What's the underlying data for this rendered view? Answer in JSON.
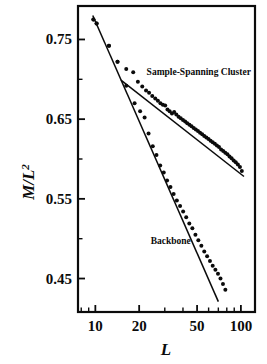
{
  "chart_data": {
    "type": "scatter",
    "title": "",
    "xlabel": "L",
    "ylabel": "M/L",
    "ylabel_exponent": "2",
    "xscale": "log",
    "yscale": "linear",
    "xlim": [
      7.6,
      125
    ],
    "ylim": [
      0.408,
      0.792
    ],
    "grid": false,
    "legend_position": "inline-annotations",
    "x_ticks": [
      10,
      20,
      50,
      100
    ],
    "x_tick_labels": [
      "10",
      "20",
      "50",
      "100"
    ],
    "x_minor_ticks": [
      8,
      9,
      30,
      40,
      60,
      70,
      80,
      90
    ],
    "y_ticks": [
      0.45,
      0.55,
      0.65,
      0.75
    ],
    "y_tick_labels": [
      "0.45",
      "0.55",
      "0.65",
      "0.75"
    ],
    "y_minor_ticks": [
      0.5,
      0.6,
      0.7
    ],
    "series": [
      {
        "name": "Sample-Spanning Cluster",
        "annotation": "Sample-Spanning Cluster",
        "annotation_x": 22.5,
        "annotation_y": 0.709,
        "marker": "filled-circle",
        "color": "#0b0b0b",
        "fit_line": {
          "x": [
            15.0,
            105.0
          ],
          "y": [
            0.699,
            0.578
          ]
        },
        "x": [
          9.7,
          10.2,
          12.4,
          14.2,
          16.3,
          18.2,
          19.6,
          21.0,
          22.3,
          23.4,
          24.6,
          25.8,
          26.9,
          28.0,
          29.1,
          30.2,
          31.3,
          32.4,
          33.6,
          34.8,
          36.0,
          37.3,
          38.6,
          40.0,
          41.4,
          42.8,
          44.3,
          45.8,
          47.4,
          49.0,
          50.7,
          52.4,
          54.2,
          56.0,
          57.9,
          59.9,
          61.9,
          64.0,
          66.2,
          68.4,
          70.7,
          73.1,
          75.6,
          78.1,
          80.8,
          83.5,
          86.3,
          89.2,
          92.2,
          95.3,
          98.5,
          101.5
        ],
        "y": [
          0.775,
          0.77,
          0.742,
          0.722,
          0.713,
          0.709,
          0.697,
          0.691,
          0.686,
          0.683,
          0.679,
          0.676,
          0.673,
          0.67,
          0.668,
          0.667,
          0.662,
          0.66,
          0.657,
          0.659,
          0.656,
          0.653,
          0.651,
          0.649,
          0.647,
          0.645,
          0.643,
          0.641,
          0.639,
          0.637,
          0.635,
          0.633,
          0.631,
          0.629,
          0.627,
          0.625,
          0.623,
          0.621,
          0.619,
          0.617,
          0.615,
          0.612,
          0.61,
          0.608,
          0.606,
          0.603,
          0.601,
          0.598,
          0.596,
          0.593,
          0.59,
          0.585
        ]
      },
      {
        "name": "Backbone",
        "annotation": "Backbone",
        "annotation_x": 24.0,
        "annotation_y": 0.497,
        "marker": "filled-circle",
        "color": "#0b0b0b",
        "fit_line": {
          "x": [
            9.6,
            70.0
          ],
          "y": [
            0.78,
            0.421
          ]
        },
        "x": [
          9.7,
          10.2,
          12.4,
          14.2,
          16.3,
          18.6,
          20.3,
          21.8,
          23.2,
          24.8,
          26.3,
          27.9,
          29.5,
          31.1,
          32.8,
          34.5,
          36.3,
          38.2,
          40.1,
          42.1,
          44.2,
          46.4,
          48.7,
          51.0,
          53.5,
          56.0,
          58.6,
          61.3,
          64.0,
          66.8,
          69.6,
          72.4,
          75.3,
          78.2
        ],
        "y": [
          0.775,
          0.77,
          0.742,
          0.722,
          0.692,
          0.67,
          0.66,
          0.652,
          0.632,
          0.616,
          0.605,
          0.592,
          0.583,
          0.573,
          0.565,
          0.556,
          0.548,
          0.541,
          0.534,
          0.527,
          0.519,
          0.513,
          0.505,
          0.498,
          0.491,
          0.484,
          0.478,
          0.472,
          0.466,
          0.461,
          0.456,
          0.45,
          0.443,
          0.436
        ]
      }
    ]
  }
}
